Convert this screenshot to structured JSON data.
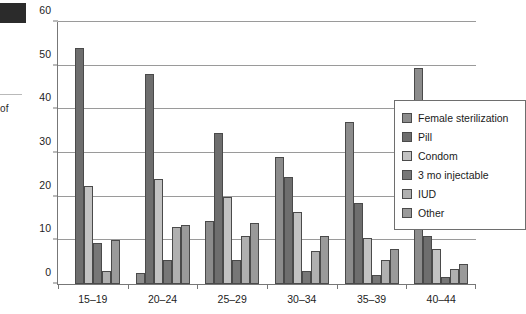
{
  "artifacts": {
    "axis_label_fragment": "of"
  },
  "legend": {
    "position": "right-inside",
    "items": [
      {
        "label": "Female sterilization",
        "color": "#8c8c8c"
      },
      {
        "label": "Pill",
        "color": "#6e6e6e"
      },
      {
        "label": "Condom",
        "color": "#c2c2c2"
      },
      {
        "label": "3 mo injectable",
        "color": "#777777"
      },
      {
        "label": "IUD",
        "color": "#b0b0b0"
      },
      {
        "label": "Other",
        "color": "#9a9a9a"
      }
    ]
  },
  "chart_data": {
    "type": "bar",
    "title": "",
    "xlabel": "",
    "ylabel": "of",
    "ylim": [
      0,
      60
    ],
    "yticks": [
      0,
      10,
      20,
      30,
      40,
      50,
      60
    ],
    "grid": true,
    "legend_position": "right",
    "categories": [
      "15–19",
      "20–24",
      "25–29",
      "30–34",
      "35–39",
      "40–44"
    ],
    "series": [
      {
        "name": "Female sterilization",
        "color": "#8c8c8c",
        "values": [
          0,
          2.5,
          14.5,
          29,
          37,
          49.5
        ]
      },
      {
        "name": "Pill",
        "color": "#6e6e6e",
        "values": [
          54,
          48,
          34.5,
          24.5,
          18.5,
          11
        ]
      },
      {
        "name": "Condom",
        "color": "#c2c2c2",
        "values": [
          22.5,
          24,
          20,
          16.5,
          10.5,
          8
        ]
      },
      {
        "name": "3 mo injectable",
        "color": "#777777",
        "values": [
          9.5,
          5.5,
          5.5,
          3,
          2,
          1.5
        ]
      },
      {
        "name": "IUD",
        "color": "#b0b0b0",
        "values": [
          3,
          13,
          11,
          7.5,
          5.5,
          3.5
        ]
      },
      {
        "name": "Other",
        "color": "#9a9a9a",
        "values": [
          10,
          13.5,
          14,
          11,
          8,
          4.5
        ]
      }
    ]
  }
}
